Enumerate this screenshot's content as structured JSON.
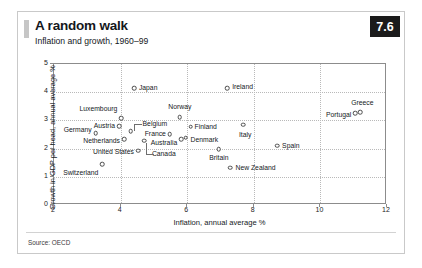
{
  "header": {
    "title": "A random walk",
    "subtitle": "Inflation and growth, 1960–99",
    "badge": "7.6"
  },
  "footer": {
    "source": "Source: OECD"
  },
  "chart_data": {
    "type": "scatter",
    "title": "A random walk",
    "subtitle": "Inflation and growth, 1960–99",
    "xlabel": "Inflation, annual average %",
    "ylabel": "Growth in GDP per head, annual average %",
    "xlim": [
      2,
      12
    ],
    "ylim": [
      0,
      5
    ],
    "xticks": [
      "2",
      "4",
      "6",
      "8",
      "10",
      "12"
    ],
    "yticks": [
      "0",
      "1",
      "2",
      "3",
      "4",
      "5"
    ],
    "grid": true,
    "legend": "none",
    "marker": "open-circle",
    "points": [
      {
        "name": "Switzerland",
        "x": 3.45,
        "y": 1.45,
        "label_pos": "l",
        "dx": -4,
        "dy": 9
      },
      {
        "name": "Germany",
        "x": 3.25,
        "y": 2.55,
        "label_pos": "l",
        "dx": -4,
        "dy": -3
      },
      {
        "name": "Austria",
        "x": 3.95,
        "y": 2.8,
        "label_pos": "l",
        "dx": -4,
        "dy": 0
      },
      {
        "name": "Luxembourg",
        "x": 4.02,
        "y": 3.07,
        "label_pos": "l",
        "dx": -4,
        "dy": -9
      },
      {
        "name": "Netherlands",
        "x": 4.1,
        "y": 2.33,
        "label_pos": "l",
        "dx": -4,
        "dy": 2
      },
      {
        "name": "Belgium",
        "x": 4.3,
        "y": 2.62,
        "label_pos": "r",
        "dx": 12,
        "dy": -7
      },
      {
        "name": "Japan",
        "x": 4.4,
        "y": 4.15,
        "label_pos": "r",
        "dx": 5,
        "dy": 0
      },
      {
        "name": "United States",
        "x": 4.52,
        "y": 1.93,
        "label_pos": "l",
        "dx": -4,
        "dy": 1
      },
      {
        "name": "Canada",
        "x": 4.7,
        "y": 2.28,
        "label_pos": "r",
        "dx": 8,
        "dy": 13
      },
      {
        "name": "France",
        "x": 5.48,
        "y": 2.52,
        "label_pos": "l",
        "dx": -4,
        "dy": 0
      },
      {
        "name": "Norway",
        "x": 5.78,
        "y": 3.12,
        "label_pos": "c",
        "dx": 0,
        "dy": -10
      },
      {
        "name": "Australia",
        "x": 5.82,
        "y": 2.33,
        "label_pos": "l",
        "dx": -4,
        "dy": 4
      },
      {
        "name": "Denmark",
        "x": 5.95,
        "y": 2.38,
        "label_pos": "r",
        "dx": 5,
        "dy": 2
      },
      {
        "name": "Finland",
        "x": 6.1,
        "y": 2.78,
        "label_pos": "r",
        "dx": 4,
        "dy": 0
      },
      {
        "name": "Britain",
        "x": 6.95,
        "y": 1.98,
        "label_pos": "c",
        "dx": 0,
        "dy": 9
      },
      {
        "name": "Ireland",
        "x": 7.2,
        "y": 4.15,
        "label_pos": "r",
        "dx": 5,
        "dy": -1
      },
      {
        "name": "New Zealand",
        "x": 7.3,
        "y": 1.32,
        "label_pos": "r",
        "dx": 5,
        "dy": 0
      },
      {
        "name": "Italy",
        "x": 7.68,
        "y": 2.85,
        "label_pos": "c",
        "dx": 2,
        "dy": 10
      },
      {
        "name": "Spain",
        "x": 8.7,
        "y": 2.1,
        "label_pos": "r",
        "dx": 5,
        "dy": 0
      },
      {
        "name": "Portugal",
        "x": 11.05,
        "y": 3.25,
        "label_pos": "l",
        "dx": -4,
        "dy": 2
      },
      {
        "name": "Greece",
        "x": 11.2,
        "y": 3.3,
        "label_pos": "c",
        "dx": 2,
        "dy": -9
      }
    ]
  }
}
